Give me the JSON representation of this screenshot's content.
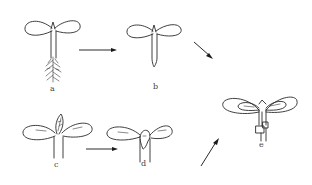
{
  "diagram": {
    "stages": [
      {
        "id": "a",
        "label": "a",
        "desc": "Seedling with cotyledons, hypocotyl and branching roots"
      },
      {
        "id": "b",
        "label": "b",
        "desc": "Seedling with cotyledons and pointed hypocotyl, roots removed"
      },
      {
        "id": "c",
        "label": "c",
        "desc": "Seedling with cotyledons and emerging leafy shoot"
      },
      {
        "id": "d",
        "label": "d",
        "desc": "Seedling with cotyledons and cut apex"
      },
      {
        "id": "e",
        "label": "e",
        "desc": "Grafted/joined seedling with two pairs of cotyledons"
      }
    ],
    "arrows": [
      {
        "from": "a",
        "to": "b"
      },
      {
        "from": "b",
        "to": "e"
      },
      {
        "from": "c",
        "to": "d"
      },
      {
        "from": "d",
        "to": "e"
      }
    ],
    "colors": {
      "line": "#2a2a2a",
      "background": "#ffffff",
      "label": "#444444"
    }
  }
}
